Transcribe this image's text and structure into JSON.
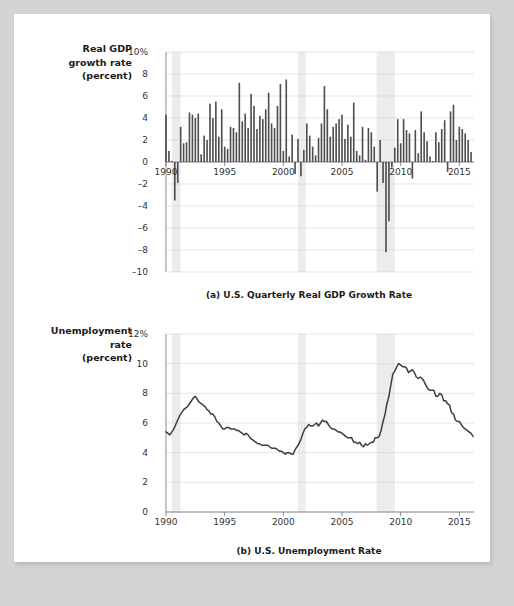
{
  "figure": {
    "background_color": "#d4d4d4",
    "sheet_color": "#ffffff",
    "bar_color": "#4d4d4d",
    "line_color": "#3d3d3d",
    "recession_band_color": "#ececec",
    "grid_color": "#d8d8d8",
    "axis_color": "#808080"
  },
  "panel_a": {
    "axis_title_lines": [
      "Real GDP",
      "growth rate",
      "(percent)"
    ],
    "caption": "(a) U.S. Quarterly Real GDP Growth Rate",
    "ytick_labels": [
      "10%",
      "8",
      "6",
      "4",
      "2",
      "0",
      "–2",
      "–4",
      "–6",
      "–8",
      "–10"
    ],
    "xtick_labels": [
      "1990",
      "1995",
      "2000",
      "2005",
      "2010",
      "2015"
    ]
  },
  "panel_b": {
    "axis_title_lines": [
      "Unemployment",
      "rate",
      "(percent)"
    ],
    "caption": "(b) U.S. Unemployment Rate",
    "ytick_labels": [
      "12%",
      "10",
      "8",
      "6",
      "4",
      "2",
      "0"
    ],
    "xtick_labels": [
      "1990",
      "1995",
      "2000",
      "2005",
      "2010",
      "2015"
    ]
  },
  "chart_data": [
    {
      "type": "bar",
      "title": "(a) U.S. Quarterly Real GDP Growth Rate",
      "xlabel": "",
      "ylabel": "Real GDP growth rate (percent)",
      "xlim": [
        1990.0,
        2016.25
      ],
      "ylim": [
        -10,
        10
      ],
      "ytick_values": [
        10,
        8,
        6,
        4,
        2,
        0,
        -2,
        -4,
        -6,
        -8,
        -10
      ],
      "xtick_values": [
        1990,
        1995,
        2000,
        2005,
        2010,
        2015
      ],
      "grid": true,
      "legend": "none",
      "recession_bands": [
        {
          "start": 1990.5,
          "end": 1991.25
        },
        {
          "start": 2001.25,
          "end": 2001.9
        },
        {
          "start": 2007.95,
          "end": 2009.5
        }
      ],
      "x": [
        1990.0,
        1990.25,
        1990.5,
        1990.75,
        1991.0,
        1991.25,
        1991.5,
        1991.75,
        1992.0,
        1992.25,
        1992.5,
        1992.75,
        1993.0,
        1993.25,
        1993.5,
        1993.75,
        1994.0,
        1994.25,
        1994.5,
        1994.75,
        1995.0,
        1995.25,
        1995.5,
        1995.75,
        1996.0,
        1996.25,
        1996.5,
        1996.75,
        1997.0,
        1997.25,
        1997.5,
        1997.75,
        1998.0,
        1998.25,
        1998.5,
        1998.75,
        1999.0,
        1999.25,
        1999.5,
        1999.75,
        2000.0,
        2000.25,
        2000.5,
        2000.75,
        2001.0,
        2001.25,
        2001.5,
        2001.75,
        2002.0,
        2002.25,
        2002.5,
        2002.75,
        2003.0,
        2003.25,
        2003.5,
        2003.75,
        2004.0,
        2004.25,
        2004.5,
        2004.75,
        2005.0,
        2005.25,
        2005.5,
        2005.75,
        2006.0,
        2006.25,
        2006.5,
        2006.75,
        2007.0,
        2007.25,
        2007.5,
        2007.75,
        2008.0,
        2008.25,
        2008.5,
        2008.75,
        2009.0,
        2009.25,
        2009.5,
        2009.75,
        2010.0,
        2010.25,
        2010.5,
        2010.75,
        2011.0,
        2011.25,
        2011.5,
        2011.75,
        2012.0,
        2012.25,
        2012.5,
        2012.75,
        2013.0,
        2013.25,
        2013.5,
        2013.75,
        2014.0,
        2014.25,
        2014.5,
        2014.75,
        2015.0,
        2015.25,
        2015.5,
        2015.75,
        2016.0
      ],
      "values": [
        4.3,
        1.0,
        0.1,
        -3.5,
        -1.9,
        3.2,
        1.7,
        1.8,
        4.5,
        4.3,
        4.0,
        4.4,
        0.7,
        2.4,
        2.0,
        5.3,
        4.0,
        5.5,
        2.3,
        4.8,
        1.4,
        1.2,
        3.2,
        3.1,
        2.7,
        7.2,
        3.7,
        4.4,
        3.1,
        6.2,
        5.1,
        3.0,
        4.2,
        3.9,
        4.8,
        6.3,
        3.5,
        3.1,
        5.1,
        7.1,
        1.0,
        7.5,
        0.5,
        2.5,
        -1.1,
        2.1,
        -1.3,
        1.1,
        3.5,
        2.4,
        1.4,
        0.6,
        2.2,
        3.5,
        6.9,
        4.8,
        2.3,
        3.2,
        3.5,
        3.9,
        4.3,
        2.1,
        3.4,
        2.3,
        5.4,
        1.0,
        0.6,
        3.2,
        0.2,
        3.1,
        2.7,
        1.4,
        -2.7,
        2.0,
        -1.9,
        -8.2,
        -5.4,
        -0.5,
        1.3,
        3.9,
        1.7,
        3.9,
        2.9,
        2.6,
        -1.5,
        2.9,
        0.8,
        4.6,
        2.7,
        1.9,
        0.5,
        0.1,
        2.7,
        1.8,
        3.0,
        3.8,
        -0.9,
        4.6,
        5.2,
        2.0,
        3.2,
        3.0,
        2.6,
        2.0,
        0.9
      ]
    },
    {
      "type": "line",
      "title": "(b) U.S. Unemployment Rate",
      "xlabel": "",
      "ylabel": "Unemployment rate (percent)",
      "xlim": [
        1990.0,
        2016.25
      ],
      "ylim": [
        0,
        12
      ],
      "ytick_values": [
        12,
        10,
        8,
        6,
        4,
        2,
        0
      ],
      "xtick_values": [
        1990,
        1995,
        2000,
        2005,
        2010,
        2015
      ],
      "grid": true,
      "legend": "none",
      "recession_bands": [
        {
          "start": 1990.5,
          "end": 1991.25
        },
        {
          "start": 2001.25,
          "end": 2001.9
        },
        {
          "start": 2007.95,
          "end": 2009.5
        }
      ],
      "x": [
        1990.0,
        1990.17,
        1990.33,
        1990.5,
        1990.67,
        1990.83,
        1991.0,
        1991.17,
        1991.33,
        1991.5,
        1991.67,
        1991.83,
        1992.0,
        1992.17,
        1992.33,
        1992.5,
        1992.67,
        1992.83,
        1993.0,
        1993.17,
        1993.33,
        1993.5,
        1993.67,
        1993.83,
        1994.0,
        1994.17,
        1994.33,
        1994.5,
        1994.67,
        1994.83,
        1995.0,
        1995.17,
        1995.33,
        1995.5,
        1995.67,
        1995.83,
        1996.0,
        1996.17,
        1996.33,
        1996.5,
        1996.67,
        1996.83,
        1997.0,
        1997.17,
        1997.33,
        1997.5,
        1997.67,
        1997.83,
        1998.0,
        1998.17,
        1998.33,
        1998.5,
        1998.67,
        1998.83,
        1999.0,
        1999.17,
        1999.33,
        1999.5,
        1999.67,
        1999.83,
        2000.0,
        2000.17,
        2000.33,
        2000.5,
        2000.67,
        2000.83,
        2001.0,
        2001.17,
        2001.33,
        2001.5,
        2001.67,
        2001.83,
        2002.0,
        2002.17,
        2002.33,
        2002.5,
        2002.67,
        2002.83,
        2003.0,
        2003.17,
        2003.33,
        2003.5,
        2003.67,
        2003.83,
        2004.0,
        2004.17,
        2004.33,
        2004.5,
        2004.67,
        2004.83,
        2005.0,
        2005.17,
        2005.33,
        2005.5,
        2005.67,
        2005.83,
        2006.0,
        2006.17,
        2006.33,
        2006.5,
        2006.67,
        2006.83,
        2007.0,
        2007.17,
        2007.33,
        2007.5,
        2007.67,
        2007.83,
        2008.0,
        2008.17,
        2008.33,
        2008.5,
        2008.67,
        2008.83,
        2009.0,
        2009.17,
        2009.33,
        2009.5,
        2009.67,
        2009.83,
        2010.0,
        2010.17,
        2010.33,
        2010.5,
        2010.67,
        2010.83,
        2011.0,
        2011.17,
        2011.33,
        2011.5,
        2011.67,
        2011.83,
        2012.0,
        2012.17,
        2012.33,
        2012.5,
        2012.67,
        2012.83,
        2013.0,
        2013.17,
        2013.33,
        2013.5,
        2013.67,
        2013.83,
        2014.0,
        2014.17,
        2014.33,
        2014.5,
        2014.67,
        2014.83,
        2015.0,
        2015.17,
        2015.33,
        2015.5,
        2015.67,
        2015.83,
        2016.0,
        2016.17
      ],
      "values": [
        5.4,
        5.3,
        5.2,
        5.4,
        5.6,
        5.9,
        6.2,
        6.5,
        6.7,
        6.9,
        7.0,
        7.1,
        7.3,
        7.5,
        7.7,
        7.8,
        7.6,
        7.4,
        7.3,
        7.2,
        7.1,
        6.9,
        6.8,
        6.6,
        6.6,
        6.4,
        6.1,
        6.0,
        5.8,
        5.6,
        5.6,
        5.7,
        5.7,
        5.6,
        5.6,
        5.6,
        5.5,
        5.5,
        5.4,
        5.3,
        5.2,
        5.3,
        5.2,
        5.0,
        4.9,
        4.8,
        4.7,
        4.6,
        4.6,
        4.5,
        4.5,
        4.5,
        4.5,
        4.4,
        4.3,
        4.3,
        4.3,
        4.2,
        4.1,
        4.1,
        4.0,
        3.9,
        4.0,
        4.0,
        3.9,
        3.9,
        4.2,
        4.4,
        4.6,
        4.9,
        5.3,
        5.6,
        5.7,
        5.9,
        5.8,
        5.8,
        5.9,
        6.0,
        5.8,
        6.0,
        6.2,
        6.1,
        6.1,
        5.9,
        5.7,
        5.6,
        5.6,
        5.5,
        5.4,
        5.4,
        5.3,
        5.2,
        5.1,
        5.0,
        5.0,
        5.0,
        4.7,
        4.7,
        4.6,
        4.7,
        4.5,
        4.4,
        4.6,
        4.5,
        4.6,
        4.7,
        4.7,
        5.0,
        5.0,
        5.1,
        5.5,
        6.1,
        6.6,
        7.3,
        7.8,
        8.6,
        9.3,
        9.5,
        9.8,
        10.0,
        9.9,
        9.8,
        9.8,
        9.7,
        9.4,
        9.5,
        9.6,
        9.4,
        9.1,
        9.0,
        9.1,
        9.0,
        8.8,
        8.5,
        8.3,
        8.2,
        8.2,
        8.2,
        7.8,
        7.8,
        8.0,
        7.9,
        7.5,
        7.5,
        7.3,
        7.2,
        6.7,
        6.6,
        6.2,
        6.1,
        6.1,
        5.9,
        5.7,
        5.6,
        5.5,
        5.4,
        5.3,
        5.1,
        5.0,
        5.0,
        4.9,
        4.9
      ]
    }
  ]
}
